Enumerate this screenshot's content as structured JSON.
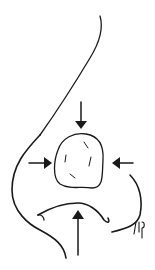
{
  "figure": {
    "type": "medical line illustration",
    "colors": {
      "stroke": "#1a1a1a",
      "background": "#ffffff"
    },
    "elements": {
      "nasal_dorsum": "curved profile line",
      "tip_graft": "rounded cartilage graft at nasal tip",
      "arrows": [
        "top",
        "left",
        "right",
        "bottom"
      ],
      "nostrils": "alar base outline with columella",
      "signature": "ltf"
    }
  }
}
